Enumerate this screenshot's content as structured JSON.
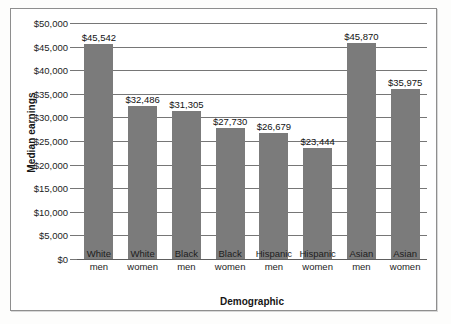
{
  "chart_data": {
    "type": "bar",
    "title": "",
    "xlabel": "Demographic",
    "ylabel": "Median earnings",
    "categories": [
      "White men",
      "White women",
      "Black men",
      "Black women",
      "Hispanic men",
      "Hispanic women",
      "Asian men",
      "Asian women"
    ],
    "category_lines": [
      [
        "White",
        "men"
      ],
      [
        "White",
        "women"
      ],
      [
        "Black",
        "men"
      ],
      [
        "Black",
        "women"
      ],
      [
        "Hispanic",
        "men"
      ],
      [
        "Hispanic",
        "women"
      ],
      [
        "Asian",
        "men"
      ],
      [
        "Asian",
        "women"
      ]
    ],
    "values": [
      45542,
      32486,
      31305,
      27730,
      26679,
      23444,
      45870,
      35975
    ],
    "value_labels": [
      "$45,542",
      "$32,486",
      "$31,305",
      "$27,730",
      "$26,679",
      "$23,444",
      "$45,870",
      "$35,975"
    ],
    "ylim": [
      0,
      50000
    ],
    "ytick_values": [
      0,
      5000,
      10000,
      15000,
      20000,
      25000,
      30000,
      35000,
      40000,
      45000,
      50000
    ],
    "ytick_labels": [
      "$0",
      "$5,000",
      "$10,000",
      "$15,000",
      "$20,000",
      "$25,000",
      "$30,000",
      "$35,000",
      "$40,000",
      "$45,000",
      "$50,000"
    ],
    "grid": true,
    "legend": false,
    "bar_color": "#7b7b7b",
    "grid_color": "#767676",
    "frame_color": "#8e8e8e",
    "background": "#ffffff"
  }
}
